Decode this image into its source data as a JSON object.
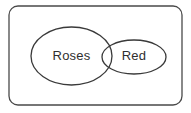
{
  "diagram": {
    "type": "euler-venn-diagram",
    "universe": {
      "name": "universal-set",
      "shape": "rounded-rectangle",
      "x": 9,
      "y": 6,
      "width": 173,
      "height": 99,
      "corner_radius": 9,
      "stroke_color": "#4a4a4a",
      "fill_color": "#ffffff"
    },
    "sets": [
      {
        "id": "roses",
        "label": "Roses",
        "shape": "ellipse",
        "cx": 71.5,
        "cy": 56,
        "rx": 40.5,
        "ry": 29,
        "label_x": 71.5,
        "label_y": 57,
        "stroke_color": "#3a3a3a",
        "fill_color": "none"
      },
      {
        "id": "red",
        "label": "Red",
        "shape": "ellipse",
        "cx": 134,
        "cy": 57,
        "rx": 32,
        "ry": 17,
        "label_x": 134,
        "label_y": 57,
        "stroke_color": "#3a3a3a",
        "fill_color": "none"
      }
    ],
    "relationship": "overlapping",
    "background_color": "#ffffff",
    "text_color": "#2f2f2f"
  }
}
